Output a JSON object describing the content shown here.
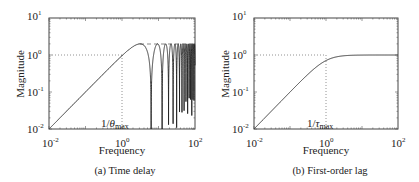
{
  "chart_data": [
    {
      "type": "line",
      "title": "",
      "caption": "(a) Time delay",
      "xlabel": "Frequency",
      "ylabel": "Magnitude",
      "xscale": "log",
      "yscale": "log",
      "xlim": [
        0.01,
        100
      ],
      "ylim": [
        0.01,
        10
      ],
      "xticks": [
        "10^-2",
        "10^0",
        "10^2"
      ],
      "yticks": [
        "10^-2",
        "10^-1",
        "10^0",
        "10^1"
      ],
      "annotation": "1/θmax",
      "reference_lines": {
        "horizontal_y": 1,
        "vertical_x": 1,
        "style": "dotted"
      },
      "series": [
        {
          "name": "|1 - e^{-jωθ}|, θ = 1",
          "x": [
            0.01,
            0.1,
            1,
            2,
            3.14,
            6.28,
            9.42,
            12.57,
            18.85,
            31.4,
            100
          ],
          "values": [
            0.01,
            0.1,
            0.96,
            1.68,
            2.0,
            0.01,
            2.0,
            0.01,
            0.01,
            0.01,
            2.0
          ]
        }
      ],
      "notes": "Rises with slope 1, peaks near 2 around ω≈π, then oscillates between ~0 and 2 with notches at multiples of 2π; dashed line at magnitude 2"
    },
    {
      "type": "line",
      "title": "",
      "caption": "(b) First-order lag",
      "xlabel": "Frequency",
      "ylabel": "Magnitude",
      "xscale": "log",
      "yscale": "log",
      "xlim": [
        0.01,
        100
      ],
      "ylim": [
        0.01,
        10
      ],
      "xticks": [
        "10^-2",
        "10^0",
        "10^2"
      ],
      "yticks": [
        "10^-2",
        "10^-1",
        "10^0",
        "10^1"
      ],
      "annotation": "1/τmax",
      "reference_lines": {
        "horizontal_y": 1,
        "vertical_x": 1,
        "style": "dotted"
      },
      "series": [
        {
          "name": "|τs/(τs+1)|, τ = 1",
          "x": [
            0.01,
            0.1,
            0.3,
            1,
            3,
            10,
            100
          ],
          "values": [
            0.01,
            0.1,
            0.29,
            0.71,
            0.95,
            1.0,
            1.0
          ]
        }
      ]
    }
  ],
  "panels": {
    "a": {
      "caption": "(a) Time delay",
      "xlabel": "Frequency",
      "ylabel": "Magnitude",
      "annotation_prefix": "1/",
      "annotation_sym": "θ",
      "annotation_sub": "max"
    },
    "b": {
      "caption": "(b) First-order lag",
      "xlabel": "Frequency",
      "ylabel": "Magnitude",
      "annotation_prefix": "1/",
      "annotation_sym": "τ",
      "annotation_sub": "max"
    }
  },
  "ticks": {
    "base": "10",
    "x": [
      "-2",
      "0",
      "2"
    ],
    "y": [
      "-2",
      "-1",
      "0",
      "1"
    ]
  }
}
